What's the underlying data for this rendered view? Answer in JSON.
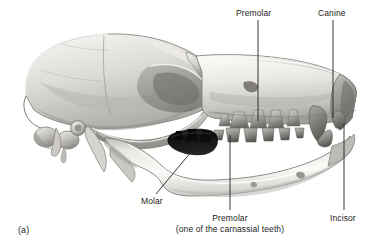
{
  "figure": {
    "panel_label": "(a)",
    "background_color": "#ffffff",
    "text_color": "#1c1c1c",
    "leader_line_color": "#232323"
  },
  "labels": {
    "premolar_upper": "Premolar",
    "canine": "Canine",
    "molar": "Molar",
    "premolar_lower": "Premolar",
    "premolar_lower_note": "(one of the carnassial teeth)",
    "incisor": "Incisor"
  },
  "illustration": {
    "style": "grayscale-pencil-shading",
    "bone_light": "#f2f1ee",
    "bone_mid": "#c9c7c2",
    "bone_shadow": "#8d8b86",
    "bone_dark": "#5d5b57",
    "tooth_fill": "#a8a6a1",
    "tooth_shadow": "#6e6c68",
    "carnassial_dark": "#141414",
    "outline": "#6b6965"
  }
}
